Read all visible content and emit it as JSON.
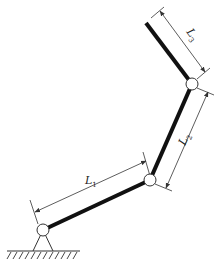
{
  "diagram": {
    "colors": {
      "link": "#111111",
      "dimension": "#333333",
      "joint_fill": "#ffffff",
      "ground": "#333333"
    },
    "joints": [
      {
        "name": "base",
        "x": 43,
        "y": 230
      },
      {
        "name": "elbow",
        "x": 150,
        "y": 180
      },
      {
        "name": "wrist",
        "x": 192,
        "y": 84
      }
    ],
    "end_effector": {
      "x": 146,
      "y": 23
    },
    "links": [
      {
        "label": "L",
        "sub": "1"
      },
      {
        "label": "L",
        "sub": "2"
      },
      {
        "label": "L",
        "sub": "3"
      }
    ]
  }
}
